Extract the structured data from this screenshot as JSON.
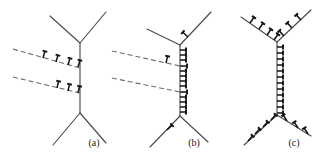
{
  "figure": {
    "background_color": "#ffffff",
    "line_color": "#4a4a52",
    "dashed_line_color": "#6a6a72",
    "barb_color": "#121216",
    "width": 322,
    "height": 157,
    "panel_count": 3
  },
  "panels": [
    {
      "id": "panel-a",
      "label": "(a)",
      "label_x": 94,
      "label_y": 146,
      "description": "triple-junction skeleton with two dashed horizontal branches carrying tack barbs",
      "skeleton": [
        {
          "name": "upper-left-arm",
          "x1": 50,
          "y1": 16,
          "x2": 80,
          "y2": 43,
          "style": "solid"
        },
        {
          "name": "upper-right-arm",
          "x1": 80,
          "y1": 43,
          "x2": 106,
          "y2": 12,
          "style": "solid"
        },
        {
          "name": "vertical-trunk",
          "x1": 80,
          "y1": 43,
          "x2": 80,
          "y2": 113,
          "style": "solid"
        },
        {
          "name": "lower-left-arm",
          "x1": 80,
          "y1": 113,
          "x2": 53,
          "y2": 145,
          "style": "solid"
        },
        {
          "name": "lower-right-arm",
          "x1": 80,
          "y1": 113,
          "x2": 106,
          "y2": 143,
          "style": "solid"
        },
        {
          "name": "upper-dashed-branch",
          "x1": 13,
          "y1": 49,
          "x2": 80,
          "y2": 68,
          "style": "dashed"
        },
        {
          "name": "lower-dashed-branch",
          "x1": 13,
          "y1": 77,
          "x2": 80,
          "y2": 93,
          "style": "dashed"
        }
      ],
      "barbs": [
        {
          "name": "barb-upper-1",
          "x": 43,
          "y": 58,
          "angle": 16,
          "length": 7
        },
        {
          "name": "barb-upper-2",
          "x": 56,
          "y": 62,
          "angle": 16,
          "length": 7
        },
        {
          "name": "barb-upper-3",
          "x": 68,
          "y": 65,
          "angle": 16,
          "length": 7
        },
        {
          "name": "barb-upper-4",
          "x": 78,
          "y": 67,
          "angle": 16,
          "length": 7
        },
        {
          "name": "barb-lower-1",
          "x": 57,
          "y": 88,
          "angle": 13,
          "length": 7
        },
        {
          "name": "barb-lower-2",
          "x": 68,
          "y": 91,
          "angle": 13,
          "length": 7
        },
        {
          "name": "barb-lower-3",
          "x": 78,
          "y": 93,
          "angle": 13,
          "length": 7
        }
      ]
    },
    {
      "id": "panel-b",
      "label": "(b)",
      "label_x": 194,
      "label_y": 146,
      "description": "same skeleton with a dense column of barbs along the vertical trunk and single barbs on two diagonals",
      "skeleton": [
        {
          "name": "upper-left-arm",
          "x1": 147,
          "y1": 29,
          "x2": 180,
          "y2": 45,
          "style": "solid"
        },
        {
          "name": "upper-right-arm",
          "x1": 180,
          "y1": 45,
          "x2": 211,
          "y2": 12,
          "style": "solid"
        },
        {
          "name": "vertical-trunk",
          "x1": 180,
          "y1": 45,
          "x2": 180,
          "y2": 116,
          "style": "solid"
        },
        {
          "name": "lower-left-arm",
          "x1": 180,
          "y1": 116,
          "x2": 150,
          "y2": 147,
          "style": "solid"
        },
        {
          "name": "lower-right-arm",
          "x1": 180,
          "y1": 116,
          "x2": 208,
          "y2": 142,
          "style": "solid"
        },
        {
          "name": "upper-dashed-branch",
          "x1": 112,
          "y1": 51,
          "x2": 180,
          "y2": 66,
          "style": "dashed"
        },
        {
          "name": "lower-dashed-branch",
          "x1": 112,
          "y1": 78,
          "x2": 180,
          "y2": 92,
          "style": "dashed"
        }
      ],
      "barbs": [
        {
          "name": "barb-trunk-1",
          "x": 180,
          "y": 50,
          "angle": 90,
          "length": 6
        },
        {
          "name": "barb-trunk-2",
          "x": 180,
          "y": 55,
          "angle": 90,
          "length": 6
        },
        {
          "name": "barb-trunk-3",
          "x": 180,
          "y": 60,
          "angle": 90,
          "length": 6
        },
        {
          "name": "barb-trunk-4",
          "x": 180,
          "y": 66,
          "angle": 90,
          "length": 7
        },
        {
          "name": "barb-trunk-5",
          "x": 180,
          "y": 71,
          "angle": 90,
          "length": 6
        },
        {
          "name": "barb-trunk-6",
          "x": 180,
          "y": 76,
          "angle": 90,
          "length": 6
        },
        {
          "name": "barb-trunk-7",
          "x": 180,
          "y": 81,
          "angle": 90,
          "length": 6
        },
        {
          "name": "barb-trunk-8",
          "x": 180,
          "y": 86,
          "angle": 90,
          "length": 6
        },
        {
          "name": "barb-trunk-9",
          "x": 180,
          "y": 92,
          "angle": 90,
          "length": 7
        },
        {
          "name": "barb-trunk-10",
          "x": 180,
          "y": 97,
          "angle": 90,
          "length": 6
        },
        {
          "name": "barb-trunk-11",
          "x": 180,
          "y": 102,
          "angle": 90,
          "length": 6
        },
        {
          "name": "barb-trunk-12",
          "x": 180,
          "y": 107,
          "angle": 90,
          "length": 6
        },
        {
          "name": "barb-trunk-13",
          "x": 180,
          "y": 112,
          "angle": 90,
          "length": 6
        },
        {
          "name": "barb-dashed-upper",
          "x": 166,
          "y": 63,
          "angle": 13,
          "length": 7
        },
        {
          "name": "barb-arm-upper-right",
          "x": 188,
          "y": 37,
          "angle": -47,
          "length": 7
        },
        {
          "name": "barb-arm-lower-left",
          "x": 167,
          "y": 130,
          "angle": 46,
          "length": 7
        }
      ]
    },
    {
      "id": "panel-c",
      "label": "(c)",
      "label_x": 294,
      "label_y": 146,
      "description": "same skeleton fully decorated with barbs on every branch and no dashed branches",
      "skeleton": [
        {
          "name": "upper-left-arm",
          "x1": 241,
          "y1": 17,
          "x2": 277,
          "y2": 42,
          "style": "solid"
        },
        {
          "name": "upper-right-arm",
          "x1": 277,
          "y1": 42,
          "x2": 311,
          "y2": 10,
          "style": "solid"
        },
        {
          "name": "vertical-trunk",
          "x1": 277,
          "y1": 42,
          "x2": 277,
          "y2": 115,
          "style": "solid"
        },
        {
          "name": "lower-left-arm",
          "x1": 277,
          "y1": 115,
          "x2": 244,
          "y2": 145,
          "style": "solid"
        },
        {
          "name": "lower-right-arm",
          "x1": 277,
          "y1": 115,
          "x2": 311,
          "y2": 136,
          "style": "solid"
        }
      ],
      "barbs": [
        {
          "name": "barb-trunk-1",
          "x": 277,
          "y": 47,
          "angle": 90,
          "length": 6
        },
        {
          "name": "barb-trunk-2",
          "x": 277,
          "y": 53,
          "angle": 90,
          "length": 6
        },
        {
          "name": "barb-trunk-3",
          "x": 277,
          "y": 59,
          "angle": 90,
          "length": 6
        },
        {
          "name": "barb-trunk-4",
          "x": 277,
          "y": 65,
          "angle": 90,
          "length": 6
        },
        {
          "name": "barb-trunk-5",
          "x": 277,
          "y": 71,
          "angle": 90,
          "length": 6
        },
        {
          "name": "barb-trunk-6",
          "x": 277,
          "y": 77,
          "angle": 90,
          "length": 6
        },
        {
          "name": "barb-trunk-7",
          "x": 277,
          "y": 83,
          "angle": 90,
          "length": 6
        },
        {
          "name": "barb-trunk-8",
          "x": 277,
          "y": 89,
          "angle": 90,
          "length": 6
        },
        {
          "name": "barb-trunk-9",
          "x": 277,
          "y": 95,
          "angle": 90,
          "length": 6
        },
        {
          "name": "barb-trunk-10",
          "x": 277,
          "y": 101,
          "angle": 90,
          "length": 6
        },
        {
          "name": "barb-trunk-11",
          "x": 277,
          "y": 107,
          "angle": 90,
          "length": 6
        },
        {
          "name": "barb-trunk-12",
          "x": 277,
          "y": 113,
          "angle": 90,
          "length": 6
        },
        {
          "name": "barb-ul-1",
          "x": 250,
          "y": 23,
          "angle": 35,
          "length": 7
        },
        {
          "name": "barb-ul-2",
          "x": 259,
          "y": 29,
          "angle": 35,
          "length": 7
        },
        {
          "name": "barb-ul-3",
          "x": 267,
          "y": 35,
          "angle": 35,
          "length": 7
        },
        {
          "name": "barb-ul-4",
          "x": 274,
          "y": 40,
          "angle": 35,
          "length": 7
        },
        {
          "name": "barb-ur-1",
          "x": 284,
          "y": 36,
          "angle": -43,
          "length": 7
        },
        {
          "name": "barb-ur-2",
          "x": 292,
          "y": 28,
          "angle": -43,
          "length": 7
        },
        {
          "name": "barb-ur-3",
          "x": 301,
          "y": 20,
          "angle": -43,
          "length": 7
        },
        {
          "name": "barb-ll-1",
          "x": 271,
          "y": 120,
          "angle": 42,
          "length": 7
        },
        {
          "name": "barb-ll-2",
          "x": 263,
          "y": 127,
          "angle": 42,
          "length": 7
        },
        {
          "name": "barb-ll-3",
          "x": 255,
          "y": 134,
          "angle": 42,
          "length": 7
        },
        {
          "name": "barb-ll-4",
          "x": 248,
          "y": 141,
          "angle": 42,
          "length": 7
        },
        {
          "name": "barb-lr-1",
          "x": 287,
          "y": 121,
          "angle": -32,
          "length": 7
        },
        {
          "name": "barb-lr-2",
          "x": 298,
          "y": 128,
          "angle": -32,
          "length": 7
        },
        {
          "name": "barb-lr-3",
          "x": 308,
          "y": 134,
          "angle": -32,
          "length": 7
        }
      ]
    }
  ]
}
